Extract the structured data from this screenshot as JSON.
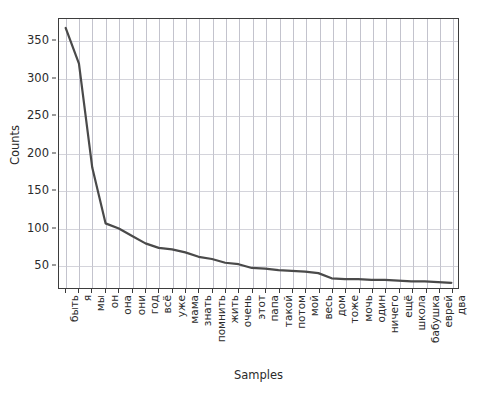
{
  "chart_data": {
    "type": "line",
    "title": "",
    "xlabel": "Samples",
    "ylabel": "Counts",
    "ylim": [
      18,
      380
    ],
    "yticks": [
      50,
      100,
      150,
      200,
      250,
      300,
      350
    ],
    "grid": true,
    "legend": null,
    "line_color": "#4a4a4a",
    "categories": [
      "быть",
      "я",
      "мы",
      "он",
      "она",
      "они",
      "год",
      "всё",
      "уже",
      "мама",
      "знать",
      "помнить",
      "жить",
      "очень",
      "этот",
      "папа",
      "такой",
      "потом",
      "мой",
      "весь",
      "дом",
      "тоже",
      "мочь",
      "один",
      "ничего",
      "ещё",
      "школа",
      "бабушка",
      "еврей",
      "два"
    ],
    "values": [
      368,
      320,
      180,
      105,
      98,
      88,
      78,
      72,
      70,
      66,
      60,
      57,
      52,
      50,
      45,
      44,
      42,
      41,
      40,
      38,
      31,
      30,
      30,
      29,
      29,
      28,
      27,
      27,
      26,
      25
    ]
  }
}
